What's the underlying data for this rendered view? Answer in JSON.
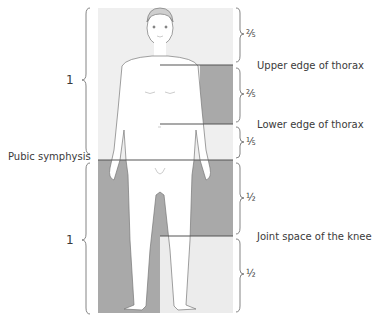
{
  "figure": {
    "colors": {
      "panel_background": "#efefef",
      "body_fill": "#ffffff",
      "shading": "#a9a9a9",
      "line": "#555555",
      "text": "#3a3a3a"
    },
    "left_annotations": {
      "upper_ratio": "1",
      "lower_ratio": "1",
      "landmark": "Pubic symphysis"
    },
    "right_annotations": [
      {
        "fraction": "⅖",
        "label": ""
      },
      {
        "fraction": "",
        "label": "Upper edge of thorax"
      },
      {
        "fraction": "⅖",
        "label": ""
      },
      {
        "fraction": "",
        "label": "Lower edge of thorax"
      },
      {
        "fraction": "⅕",
        "label": ""
      },
      {
        "fraction": "½",
        "label": ""
      },
      {
        "fraction": "",
        "label": "Joint space of the knee"
      },
      {
        "fraction": "½",
        "label": ""
      }
    ]
  }
}
